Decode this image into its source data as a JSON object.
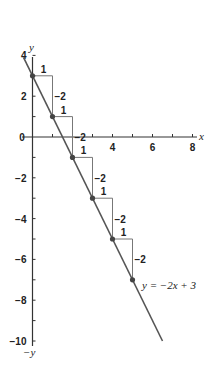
{
  "chart_data": {
    "type": "line",
    "title": "",
    "xlabel": "x",
    "ylabel": "y",
    "neg_ylabel": "-y",
    "xlim": [
      0,
      8
    ],
    "ylim": [
      -10,
      4
    ],
    "x_ticks": [
      1,
      2,
      3,
      4,
      5,
      6,
      7,
      8
    ],
    "x_tick_labels": [
      {
        "value": 0,
        "label": "0"
      },
      {
        "value": 4,
        "label": "4"
      },
      {
        "value": 6,
        "label": "6"
      },
      {
        "value": 8,
        "label": "8"
      }
    ],
    "y_ticks": [
      4,
      3,
      2,
      1,
      -1,
      -2,
      -3,
      -4,
      -5,
      -6,
      -7,
      -8,
      -9,
      -10
    ],
    "y_tick_labels": [
      {
        "value": 4,
        "label": "4"
      },
      {
        "value": 2,
        "label": "2"
      },
      {
        "value": -2,
        "label": "−2"
      },
      {
        "value": -4,
        "label": "−4"
      },
      {
        "value": -6,
        "label": "−6"
      },
      {
        "value": -8,
        "label": "−8"
      },
      {
        "value": -10,
        "label": "−10"
      }
    ],
    "grid": false,
    "series": [
      {
        "name": "y = −2x + 3",
        "slope": -2,
        "intercept": 3,
        "line_x_range": [
          -0.45,
          6.5
        ],
        "points": [
          {
            "x": 0,
            "y": 3
          },
          {
            "x": 1,
            "y": 1
          },
          {
            "x": 2,
            "y": -1
          },
          {
            "x": 3,
            "y": -3
          },
          {
            "x": 4,
            "y": -5
          },
          {
            "x": 5,
            "y": -7
          }
        ]
      }
    ],
    "steps": [
      {
        "from_x": 0,
        "from_y": 3,
        "run_label": "1",
        "rise_label": "−2"
      },
      {
        "from_x": 1,
        "from_y": 1,
        "run_label": "1",
        "rise_label": "−2"
      },
      {
        "from_x": 2,
        "from_y": -1,
        "run_label": "1",
        "rise_label": "−2"
      },
      {
        "from_x": 3,
        "from_y": -3,
        "run_label": "1",
        "rise_label": "−2"
      },
      {
        "from_x": 4,
        "from_y": -5,
        "run_label": "1",
        "rise_label": "−2"
      }
    ],
    "annotations": [
      {
        "text": "y = −2x + 3",
        "at_x": 5,
        "at_y": -7
      }
    ]
  },
  "labels": {
    "x_axis": "x",
    "y_axis": "y",
    "neg_y_axis": "−y",
    "equation": "y = −2x + 3"
  }
}
